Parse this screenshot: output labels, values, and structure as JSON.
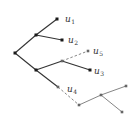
{
  "diagram": {
    "type": "tree",
    "colors": {
      "edge_dark": "#333333",
      "edge_light": "#777777",
      "node_dark": "#1a1a1a",
      "node_light": "#666666",
      "label": "#333333"
    },
    "nodes": [
      {
        "id": "root",
        "x": 15,
        "y": 53,
        "tone": "dark"
      },
      {
        "id": "a",
        "x": 36,
        "y": 35,
        "tone": "dark"
      },
      {
        "id": "u1",
        "x": 57,
        "y": 19,
        "tone": "dark"
      },
      {
        "id": "u2",
        "x": 62,
        "y": 40,
        "tone": "dark"
      },
      {
        "id": "b",
        "x": 36,
        "y": 70,
        "tone": "dark"
      },
      {
        "id": "c",
        "x": 62,
        "y": 61,
        "tone": "light"
      },
      {
        "id": "u5",
        "x": 88,
        "y": 51,
        "tone": "light"
      },
      {
        "id": "u3",
        "x": 90,
        "y": 70,
        "tone": "dark"
      },
      {
        "id": "d",
        "x": 58,
        "y": 87,
        "tone": "light"
      },
      {
        "id": "e",
        "x": 79,
        "y": 105,
        "tone": "light"
      },
      {
        "id": "f",
        "x": 101,
        "y": 95,
        "tone": "light"
      },
      {
        "id": "g",
        "x": 126,
        "y": 86,
        "tone": "light"
      },
      {
        "id": "h",
        "x": 122,
        "y": 112,
        "tone": "light"
      }
    ],
    "edges": [
      {
        "from": "root",
        "to": "a",
        "style": "solid",
        "tone": "dark"
      },
      {
        "from": "a",
        "to": "u1",
        "style": "solid",
        "tone": "dark"
      },
      {
        "from": "a",
        "to": "u2",
        "style": "solid",
        "tone": "dark"
      },
      {
        "from": "root",
        "to": "b",
        "style": "solid",
        "tone": "dark"
      },
      {
        "from": "b",
        "to": "c",
        "style": "solid",
        "tone": "dark"
      },
      {
        "from": "c",
        "to": "u5",
        "style": "dashed",
        "tone": "light"
      },
      {
        "from": "c",
        "to": "u3",
        "style": "solid",
        "tone": "dark"
      },
      {
        "from": "b",
        "to": "d",
        "style": "solid",
        "tone": "dark"
      },
      {
        "from": "d",
        "to": "e",
        "style": "dashed",
        "tone": "light"
      },
      {
        "from": "e",
        "to": "f",
        "style": "solid",
        "tone": "light"
      },
      {
        "from": "f",
        "to": "g",
        "style": "solid",
        "tone": "light"
      },
      {
        "from": "f",
        "to": "h",
        "style": "solid",
        "tone": "light"
      }
    ],
    "labels": [
      {
        "base": "u",
        "sub": "1",
        "x": 65,
        "y": 22
      },
      {
        "base": "u",
        "sub": "2",
        "x": 68,
        "y": 43
      },
      {
        "base": "u",
        "sub": "5",
        "x": 93,
        "y": 54
      },
      {
        "base": "u",
        "sub": "3",
        "x": 94,
        "y": 74
      },
      {
        "base": "u",
        "sub": "4",
        "x": 67,
        "y": 92
      }
    ]
  }
}
